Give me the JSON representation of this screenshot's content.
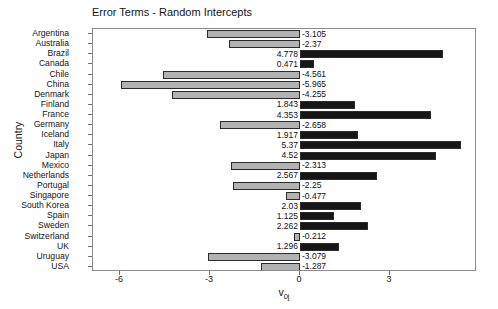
{
  "chart_data": {
    "type": "bar",
    "orientation": "horizontal",
    "title": "Error Terms - Random Intercepts",
    "xlabel": "v0j",
    "xlabel_base": "v",
    "xlabel_sub": "0j",
    "ylabel": "Country",
    "xlim": [
      -6.9,
      5.9
    ],
    "x_ticks": [
      -6,
      -3,
      0,
      3
    ],
    "x_tick_labels": [
      "-6",
      "-3",
      "0",
      "3"
    ],
    "grid": false,
    "legend": "none",
    "colors": {
      "negative_bar": "#b2b2b2",
      "positive_bar": "#161616",
      "bar_border": "#2b2b2b",
      "axis": "#8c8c8c",
      "text": "#141414",
      "background": "#ffffff"
    },
    "categories": [
      "Argentina",
      "Australia",
      "Brazil",
      "Canada",
      "Chile",
      "China",
      "Denmark",
      "Finland",
      "France",
      "Germany",
      "Iceland",
      "Italy",
      "Japan",
      "Mexico",
      "Netherlands",
      "Portugal",
      "Singapore",
      "South Korea",
      "Spain",
      "Sweden",
      "Switzerland",
      "UK",
      "Uruguay",
      "USA"
    ],
    "values": [
      -3.105,
      -2.37,
      4.778,
      0.471,
      -4.561,
      -5.965,
      -4.255,
      1.843,
      4.353,
      -2.658,
      1.917,
      5.37,
      4.52,
      -2.313,
      2.567,
      -2.25,
      -0.477,
      2.03,
      1.125,
      2.262,
      -0.212,
      1.296,
      -3.079,
      -1.287
    ],
    "value_labels": [
      "-3.105",
      "-2.37",
      "4.778",
      "0.471",
      "-4.561",
      "-5.965",
      "-4.255",
      "1.843",
      "4.353",
      "-2.658",
      "1.917",
      "5.37",
      "4.52",
      "-2.313",
      "2.567",
      "-2.25",
      "-0.477",
      "2.03",
      "1.125",
      "2.262",
      "-0.212",
      "1.296",
      "-3.079",
      "-1.287"
    ]
  }
}
